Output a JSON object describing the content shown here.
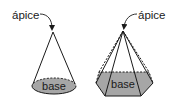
{
  "figures": {
    "cone": {
      "apex_label": "ápice",
      "base_label": "base"
    },
    "pyramid": {
      "apex_label": "ápice",
      "base_label": "base"
    }
  },
  "colors": {
    "line": "#1a1a1a",
    "base_fill": "#a6a6a6",
    "background": "#ffffff"
  }
}
